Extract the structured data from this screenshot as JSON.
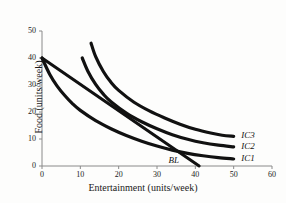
{
  "chart_data": {
    "type": "line",
    "title": "",
    "xlabel": "Entertainment (units/week)",
    "ylabel": "Food (units/week)",
    "xlim": [
      0,
      60
    ],
    "ylim": [
      0,
      50
    ],
    "xticks": [
      "0",
      "10",
      "20",
      "30",
      "40",
      "50",
      "60"
    ],
    "yticks": [
      "0",
      "10",
      "20",
      "30",
      "40",
      "50"
    ],
    "grid": false,
    "legend_position": "inline-right-of-curve-ends",
    "line_color": "#111111",
    "axis_color": "#8a8a8a",
    "series": [
      {
        "name": "IC1",
        "label": "IC1",
        "label_x": 52,
        "label_y": 2.5,
        "points": [
          [
            0,
            40
          ],
          [
            2,
            34
          ],
          [
            4,
            29.5
          ],
          [
            6,
            26
          ],
          [
            8,
            23
          ],
          [
            10,
            20.6
          ],
          [
            14,
            16.8
          ],
          [
            18,
            13.8
          ],
          [
            22,
            11.3
          ],
          [
            26,
            9.2
          ],
          [
            30,
            7.4
          ],
          [
            34,
            5.9
          ],
          [
            38,
            4.7
          ],
          [
            42,
            3.8
          ],
          [
            46,
            3.1
          ],
          [
            50,
            2.6
          ]
        ]
      },
      {
        "name": "IC2",
        "label": "IC2",
        "label_x": 52,
        "label_y": 7,
        "points": [
          [
            10.5,
            40
          ],
          [
            12,
            35
          ],
          [
            14,
            30.2
          ],
          [
            16,
            26.6
          ],
          [
            18,
            23.8
          ],
          [
            22,
            19.6
          ],
          [
            26,
            16.4
          ],
          [
            30,
            13.8
          ],
          [
            34,
            11.6
          ],
          [
            38,
            9.9
          ],
          [
            42,
            8.6
          ],
          [
            46,
            7.7
          ],
          [
            50,
            7.1
          ]
        ]
      },
      {
        "name": "IC3",
        "label": "IC3",
        "label_x": 52,
        "label_y": 11,
        "points": [
          [
            12.8,
            45.5
          ],
          [
            14,
            40.5
          ],
          [
            16,
            35
          ],
          [
            18,
            31
          ],
          [
            20,
            28
          ],
          [
            24,
            23.6
          ],
          [
            28,
            20.4
          ],
          [
            32,
            17.8
          ],
          [
            36,
            15.5
          ],
          [
            40,
            13.6
          ],
          [
            44,
            12.2
          ],
          [
            47,
            11.4
          ],
          [
            50,
            11
          ]
        ]
      }
    ],
    "budget_line": {
      "name": "BL",
      "label": "BL",
      "label_x": 33,
      "label_y": 1.8,
      "points": [
        [
          0,
          40
        ],
        [
          41,
          0
        ]
      ]
    },
    "annotations": []
  }
}
